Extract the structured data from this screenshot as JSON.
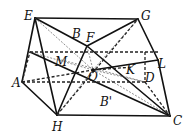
{
  "diagram": {
    "type": "solid-geometry",
    "labels": {
      "E": "E",
      "G": "G",
      "B": "B",
      "F": "F",
      "M": "M",
      "O": "O",
      "K": "K",
      "L": "L",
      "D": "D",
      "A": "A",
      "H": "H",
      "C": "C",
      "Bp": "B'"
    },
    "points": {
      "E": [
        35,
        18
      ],
      "G": [
        138,
        19
      ],
      "F": [
        87,
        46
      ],
      "M": [
        58,
        59
      ],
      "O": [
        93,
        70
      ],
      "K": [
        133,
        67
      ],
      "L": [
        158,
        60
      ],
      "D": [
        145,
        82
      ],
      "A": [
        22,
        82
      ],
      "H": [
        57,
        115
      ],
      "C": [
        170,
        116
      ],
      "P": [
        30,
        52
      ]
    }
  }
}
